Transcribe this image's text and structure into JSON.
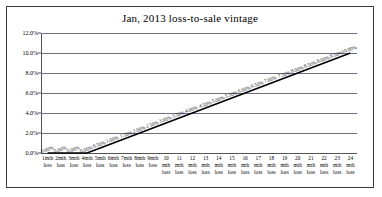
{
  "chart_data": {
    "type": "line",
    "title": "Jan, 2013 loss-to-sale vintage",
    "xlabel": "",
    "ylabel": "",
    "ylim": [
      0,
      12
    ],
    "yticks": [
      "0.0%",
      "2.0%",
      "4.0%",
      "6.0%",
      "8.0%",
      "10.0%",
      "12.0%"
    ],
    "ytick_values": [
      0,
      2,
      4,
      6,
      8,
      10,
      12
    ],
    "grid": true,
    "legend": "none",
    "line_color": "#000000",
    "gridline_color": "#6f6f8a",
    "categories": [
      "1mth loss",
      "2mth loss",
      "3mth loss",
      "4mth loss",
      "5mth loss",
      "6mth loss",
      "7mth loss",
      "8mth loss",
      "9mth loss",
      "10 mth loss",
      "11 mth loss",
      "12 mth loss",
      "13 mth loss",
      "14 mth loss",
      "15 mth loss",
      "16 mth loss",
      "17 mth loss",
      "18 mth loss",
      "19 mth loss",
      "20 mth loss",
      "21 mth loss",
      "22 mth loss",
      "23 mth loss",
      "24 mth loss"
    ],
    "category_lines": [
      [
        "1mth",
        "loss"
      ],
      [
        "2mth",
        "loss"
      ],
      [
        "3mth",
        "loss"
      ],
      [
        "4mth",
        "loss"
      ],
      [
        "5mth",
        "loss"
      ],
      [
        "6mth",
        "loss"
      ],
      [
        "7mth",
        "loss"
      ],
      [
        "8mth",
        "loss"
      ],
      [
        "9mth",
        "loss"
      ],
      [
        "10",
        "mth",
        "loss"
      ],
      [
        "11",
        "mth",
        "loss"
      ],
      [
        "12",
        "mth",
        "loss"
      ],
      [
        "13",
        "mth",
        "loss"
      ],
      [
        "14",
        "mth",
        "loss"
      ],
      [
        "15",
        "mth",
        "loss"
      ],
      [
        "16",
        "mth",
        "loss"
      ],
      [
        "17",
        "mth",
        "loss"
      ],
      [
        "18",
        "mth",
        "loss"
      ],
      [
        "19",
        "mth",
        "loss"
      ],
      [
        "20",
        "mth",
        "loss"
      ],
      [
        "21",
        "mth",
        "loss"
      ],
      [
        "22",
        "mth",
        "loss"
      ],
      [
        "23",
        "mth",
        "loss"
      ],
      [
        "24",
        "mth",
        "loss"
      ]
    ],
    "values": [
      0.0,
      0.0,
      0.0,
      0.0,
      0.5,
      1.0,
      1.5,
      2.0,
      2.5,
      3.0,
      3.5,
      4.0,
      4.5,
      5.0,
      5.5,
      6.0,
      6.5,
      7.0,
      7.5,
      8.0,
      8.5,
      9.0,
      9.5,
      10.0
    ],
    "data_labels": [
      "0.00%",
      "0.00%",
      "0.00%",
      "0.00%",
      "0.50%",
      "1.00%",
      "1.50%",
      "2.00%",
      "2.50%",
      "3.00%",
      "3.50%",
      "4.00%",
      "4.50%",
      "5.00%",
      "5.50%",
      "6.00%",
      "6.50%",
      "7.00%",
      "7.50%",
      "8.00%",
      "8.50%",
      "9.00%",
      "9.50%",
      "10.00%"
    ]
  }
}
